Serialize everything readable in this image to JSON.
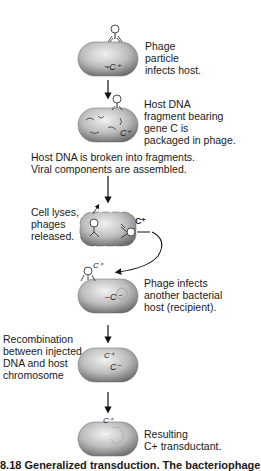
{
  "figure": {
    "type": "process-diagram",
    "topic": "Generalized transduction",
    "steps": [
      {
        "id": 1,
        "label": "Phage\nparticle\ninfects host.",
        "cell_gene": "C+"
      },
      {
        "id": 2,
        "label": "Host DNA\nfragment bearing\ngene C is\npackaged in phage.",
        "cell_gene": "C+"
      },
      {
        "id": 3,
        "label": "Host DNA is broken into fragments.\nViral components are assembled."
      },
      {
        "id": 4,
        "label": "Cell lyses,\nphages\nreleased.",
        "phage_gene": "C+"
      },
      {
        "id": 5,
        "label": "Phage infects\nanother bacterial\nhost (recipient).",
        "phage_gene": "C+",
        "cell_gene": "C−"
      },
      {
        "id": 6,
        "label": "Recombination\nbetween injected\nDNA and host\nchromosome",
        "genes": [
          "C+",
          "C−"
        ]
      },
      {
        "id": 7,
        "label": "Resulting\nC+ transductant.",
        "cell_gene": "C+"
      }
    ],
    "caption_partial": "8.18  Generalized transduction.  The bacteriophage"
  }
}
